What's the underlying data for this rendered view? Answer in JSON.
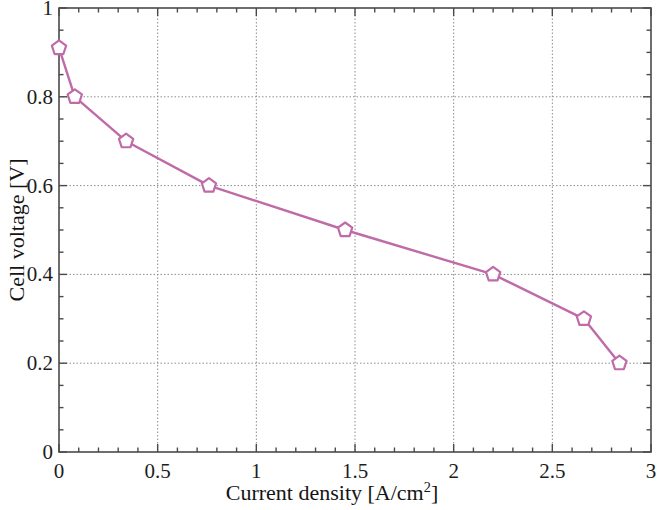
{
  "chart_data": {
    "type": "line",
    "title": "",
    "xlabel": "Current density [A/cm2]",
    "xlabel_base": "Current density [A/cm",
    "xlabel_exponent": "2",
    "xlabel_suffix": "]",
    "ylabel": "Cell voltage [V]",
    "xlim": [
      0,
      3
    ],
    "ylim": [
      0,
      1
    ],
    "grid": true,
    "grid_color": "#8c8c8c",
    "grid_style": "dashed",
    "legend": "none",
    "xticks": [
      0,
      0.5,
      1,
      1.5,
      2,
      2.5,
      3
    ],
    "xtick_labels": [
      "0",
      "0.5",
      "1",
      "1.5",
      "2",
      "2.5",
      "3"
    ],
    "xtick_minor_step": 0.1,
    "yticks": [
      0,
      0.2,
      0.4,
      0.6,
      0.8,
      1
    ],
    "ytick_labels": [
      "0",
      "0.2",
      "0.4",
      "0.6",
      "0.8",
      "1"
    ],
    "ytick_minor_step": 0.05,
    "series": [
      {
        "name": "polarization-curve",
        "color": "#be6ba8",
        "marker": "pentagon",
        "marker_fill": "#ffffff",
        "line_width": 2.4,
        "x": [
          0,
          0.08,
          0.34,
          0.76,
          1.45,
          2.2,
          2.66,
          2.84
        ],
        "y": [
          0.91,
          0.8,
          0.7,
          0.6,
          0.5,
          0.4,
          0.3,
          0.2
        ]
      }
    ]
  },
  "axes": {
    "box_color": "#4a4a4a",
    "tick_color": "#4a4a4a"
  }
}
